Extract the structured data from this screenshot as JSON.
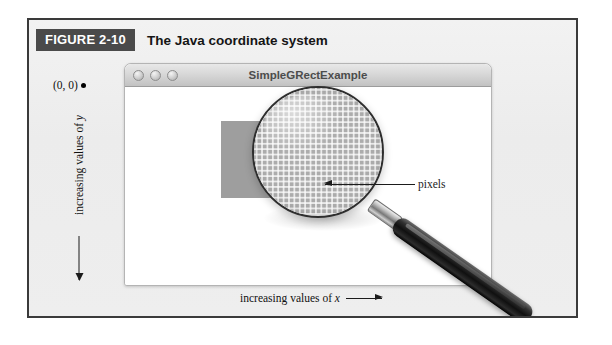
{
  "figure": {
    "tag": "FIGURE 2-10",
    "title": "The Java coordinate system",
    "frame_border_color": "#3a3a3a",
    "background_color": "#efefef",
    "tag_background_color": "#4a4a4a",
    "tag_text_color": "#ffffff"
  },
  "window": {
    "title": "SimpleGRectExample",
    "titlebar_style": "mac-aqua-grayscale",
    "buttons": [
      {
        "name": "close-button",
        "label": ""
      },
      {
        "name": "minimize-button",
        "label": ""
      },
      {
        "name": "zoom-button",
        "label": ""
      }
    ],
    "canvas_background": "#ffffff"
  },
  "graphics": {
    "rect": {
      "name": "grect",
      "fill_color": "#9e9e9e",
      "origin_label": "(100, 50)"
    },
    "origin_label": "(0, 0)",
    "magnifier": {
      "name": "magnifying-glass",
      "lens_rim_color": "#2e2e2e",
      "handle_color": "#101010",
      "pixel_grid_color": "#a6a6a6"
    }
  },
  "annotations": {
    "pixels_callout": "pixels",
    "y_axis_label_prefix": "increasing values of ",
    "y_axis_label_var": "y",
    "x_axis_label_prefix": "increasing values of ",
    "x_axis_label_var": "x"
  }
}
